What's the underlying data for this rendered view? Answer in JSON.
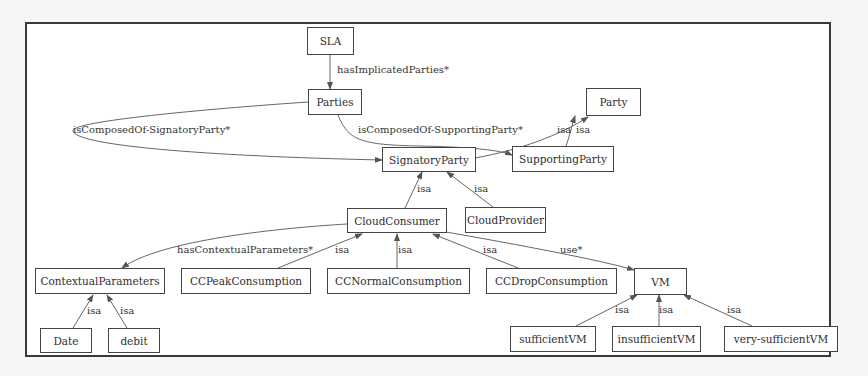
{
  "diagram": {
    "type": "ontology-graph",
    "nodes": {
      "sla": "SLA",
      "parties": "Parties",
      "party": "Party",
      "signatory_party": "SignatoryParty",
      "supporting_party": "SupportingParty",
      "cloud_consumer": "CloudConsumer",
      "cloud_provider": "CloudProvider",
      "contextual_parameters": "ContextualParameters",
      "cc_peak": "CCPeakConsumption",
      "cc_normal": "CCNormalConsumption",
      "cc_drop": "CCDropConsumption",
      "vm": "VM",
      "date": "Date",
      "debit": "debit",
      "sufficient_vm": "sufficientVM",
      "insufficient_vm": "insufficientVM",
      "very_sufficient_vm": "very-sufficientVM"
    },
    "edge_labels": {
      "has_implicated_parties": "hasImplicatedParties*",
      "composed_signatory": "isComposedOf-SignatoryParty*",
      "composed_supporting": "isComposedOf-SupportingParty*",
      "isa": "isa",
      "has_contextual_parameters": "hasContextualParameters*",
      "use": "use*"
    },
    "edges": [
      {
        "from": "SLA",
        "to": "Parties",
        "label": "hasImplicatedParties*"
      },
      {
        "from": "Parties",
        "to": "SignatoryParty",
        "label": "isComposedOf-SignatoryParty*"
      },
      {
        "from": "Parties",
        "to": "SupportingParty",
        "label": "isComposedOf-SupportingParty*"
      },
      {
        "from": "SignatoryParty",
        "to": "Party",
        "label": "isa"
      },
      {
        "from": "SupportingParty",
        "to": "Party",
        "label": "isa"
      },
      {
        "from": "CloudConsumer",
        "to": "SignatoryParty",
        "label": "isa"
      },
      {
        "from": "CloudProvider",
        "to": "SignatoryParty",
        "label": "isa"
      },
      {
        "from": "CloudConsumer",
        "to": "ContextualParameters",
        "label": "hasContextualParameters*"
      },
      {
        "from": "CCPeakConsumption",
        "to": "CloudConsumer",
        "label": "isa"
      },
      {
        "from": "CCNormalConsumption",
        "to": "CloudConsumer",
        "label": "isa"
      },
      {
        "from": "CCDropConsumption",
        "to": "CloudConsumer",
        "label": "isa"
      },
      {
        "from": "CloudConsumer",
        "to": "VM",
        "label": "use*"
      },
      {
        "from": "Date",
        "to": "ContextualParameters",
        "label": "isa"
      },
      {
        "from": "debit",
        "to": "ContextualParameters",
        "label": "isa"
      },
      {
        "from": "sufficientVM",
        "to": "VM",
        "label": "isa"
      },
      {
        "from": "insufficientVM",
        "to": "VM",
        "label": "isa"
      },
      {
        "from": "very-sufficientVM",
        "to": "VM",
        "label": "isa"
      }
    ]
  },
  "colors": {
    "line": "#555555",
    "border": "#3a3a3a",
    "background": "#f6f6f4"
  }
}
